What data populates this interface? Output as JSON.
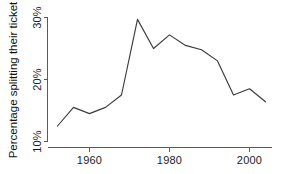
{
  "chart_data": {
    "type": "line",
    "title": "",
    "subtitle": "",
    "xlabel": "",
    "ylabel": "Percentage splitting their ticket",
    "xlim": [
      1950,
      2006
    ],
    "ylim": [
      10,
      31.5
    ],
    "grid": false,
    "legend": null,
    "x_ticks": [
      1960,
      1980,
      2000
    ],
    "x_tick_labels": [
      "1960",
      "1980",
      "2000"
    ],
    "y_ticks": [
      10,
      20,
      30
    ],
    "y_tick_labels": [
      "10%",
      "20%",
      "30%"
    ],
    "series": [
      {
        "name": "Percentage splitting their ticket",
        "color": "#3b3b3b",
        "x": [
          1952,
          1956,
          1960,
          1964,
          1968,
          1972,
          1976,
          1980,
          1984,
          1988,
          1992,
          1996,
          2000,
          2004
        ],
        "values": [
          12.5,
          15.5,
          14.5,
          15.5,
          17.5,
          29.7,
          25.0,
          27.2,
          25.5,
          24.8,
          23.0,
          17.5,
          18.5,
          16.4
        ]
      }
    ],
    "annotations": []
  },
  "axes": {
    "y_title": "Percentage splitting their ticket",
    "y_labels": [
      "30%",
      "20%",
      "10%"
    ],
    "x_labels": [
      "1960",
      "1980",
      "2000"
    ]
  }
}
